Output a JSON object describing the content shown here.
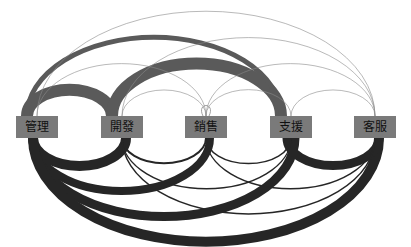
{
  "diagram": {
    "type": "arc-diagram",
    "node_color": "#7a7a7a",
    "edge_color": "#3a3a3a",
    "nodes": [
      {
        "id": "mgmt",
        "label": "管理",
        "x": 37
      },
      {
        "id": "dev",
        "label": "開發",
        "x": 122
      },
      {
        "id": "sales",
        "label": "銷售",
        "x": 206
      },
      {
        "id": "support",
        "label": "支援",
        "x": 291
      },
      {
        "id": "cs",
        "label": "客服",
        "x": 375
      }
    ],
    "edges_top": [
      {
        "from": 0,
        "to": 1,
        "w": 12
      },
      {
        "from": 1,
        "to": 3,
        "w": 12
      },
      {
        "from": 0,
        "to": 3,
        "w": 5
      },
      {
        "from": 0,
        "to": 4,
        "w": 0.6
      },
      {
        "from": 0,
        "to": 2,
        "w": 0.6
      },
      {
        "from": 1,
        "to": 4,
        "w": 0.6
      },
      {
        "from": 1,
        "to": 2,
        "w": 0.6
      },
      {
        "from": 2,
        "to": 3,
        "w": 0.6
      },
      {
        "from": 2,
        "to": 4,
        "w": 0.6
      },
      {
        "from": 3,
        "to": 4,
        "w": 0.6
      },
      {
        "from": 2,
        "to": 2,
        "w": 0.8
      }
    ],
    "edges_bottom": [
      {
        "from": 0,
        "to": 1,
        "w": 10
      },
      {
        "from": 0,
        "to": 2,
        "w": 8
      },
      {
        "from": 0,
        "to": 3,
        "w": 9
      },
      {
        "from": 0,
        "to": 4,
        "w": 10
      },
      {
        "from": 3,
        "to": 4,
        "w": 9
      },
      {
        "from": 1,
        "to": 2,
        "w": 2
      },
      {
        "from": 1,
        "to": 3,
        "w": 1.5
      },
      {
        "from": 1,
        "to": 4,
        "w": 1.5
      },
      {
        "from": 2,
        "to": 3,
        "w": 1.5
      },
      {
        "from": 2,
        "to": 4,
        "w": 1.5
      }
    ]
  }
}
